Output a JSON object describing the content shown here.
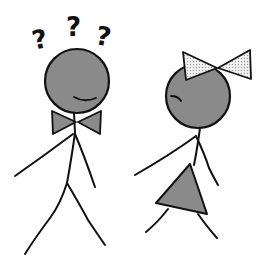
{
  "illustration": {
    "description": "Two stick figures: a confused boy with question marks and a bowtie, and a girl with a hair bow and dress turning away",
    "colors": {
      "stroke": "#111111",
      "fill_gray": "#8a8a8a",
      "bow_fill": "#e4e4e4",
      "background": "#ffffff"
    },
    "boy": {
      "question_marks": [
        "?",
        "?",
        "?"
      ]
    }
  }
}
